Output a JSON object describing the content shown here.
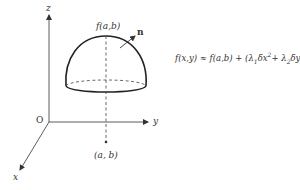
{
  "diagram": {
    "axes": {
      "z_label": "z",
      "y_label": "y",
      "x_label": "x",
      "origin_label": "O"
    },
    "surface": {
      "peak_label": "f(a,b)",
      "normal_label": "n",
      "base_point_label": "(a, b)"
    },
    "formula": {
      "lhs": "f(x,y)",
      "approx": "≈",
      "rhs_part1": "f(a,b) + (λ",
      "sub1": "1",
      "mid1": "δx",
      "sup1": "2",
      "plus": "+ λ",
      "sub2": "2",
      "mid2": "δy",
      "sup2": "2",
      "tail": ")/2"
    },
    "colors": {
      "stroke": "#333333",
      "background": "#ffffff"
    }
  }
}
